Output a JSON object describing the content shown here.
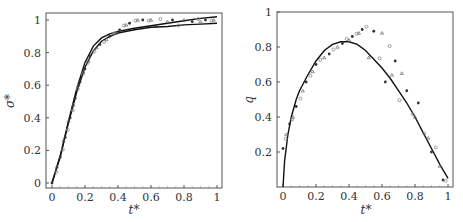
{
  "chart_data": [
    {
      "type": "scatter",
      "title": "",
      "xlabel": "t*",
      "ylabel": "σ*",
      "xlim": [
        0,
        1
      ],
      "ylim": [
        0,
        1.03
      ],
      "xticks": [
        "0",
        "0.2",
        "0.4",
        "0.6",
        "0.8",
        "1"
      ],
      "yticks": [
        "0",
        "0.2",
        "0.4",
        "0.6",
        "0.8",
        "1"
      ],
      "grid": false,
      "legend": null,
      "series": [
        {
          "name": "model curve",
          "kind": "line",
          "x": [
            0,
            0.05,
            0.1,
            0.15,
            0.2,
            0.25,
            0.3,
            0.35,
            0.4,
            0.5,
            0.6,
            0.7,
            0.8,
            0.9,
            1.0
          ],
          "y": [
            0,
            0.17,
            0.38,
            0.58,
            0.74,
            0.84,
            0.89,
            0.915,
            0.93,
            0.95,
            0.965,
            0.98,
            0.995,
            1.01,
            1.02
          ]
        },
        {
          "name": "model curve 2",
          "kind": "line",
          "x": [
            0,
            0.05,
            0.1,
            0.15,
            0.2,
            0.25,
            0.3,
            0.35,
            0.4,
            0.5,
            0.6,
            0.7,
            0.8,
            0.9,
            1.0
          ],
          "y": [
            0,
            0.16,
            0.37,
            0.56,
            0.71,
            0.81,
            0.87,
            0.9,
            0.92,
            0.94,
            0.955,
            0.96,
            0.97,
            0.975,
            0.98
          ]
        },
        {
          "name": "experimental data",
          "kind": "scatter",
          "x": [
            0.0,
            0.02,
            0.03,
            0.05,
            0.06,
            0.07,
            0.08,
            0.09,
            0.1,
            0.11,
            0.12,
            0.13,
            0.14,
            0.15,
            0.16,
            0.17,
            0.18,
            0.19,
            0.2,
            0.21,
            0.22,
            0.23,
            0.25,
            0.27,
            0.29,
            0.31,
            0.33,
            0.35,
            0.37,
            0.39,
            0.41,
            0.43,
            0.45,
            0.47,
            0.5,
            0.52,
            0.55,
            0.58,
            0.6,
            0.63,
            0.65,
            0.7,
            0.73,
            0.76,
            0.8,
            0.85,
            0.88,
            0.9,
            0.93,
            0.96,
            0.98
          ],
          "y": [
            0.0,
            0.06,
            0.1,
            0.16,
            0.2,
            0.26,
            0.28,
            0.32,
            0.38,
            0.4,
            0.44,
            0.48,
            0.52,
            0.57,
            0.6,
            0.62,
            0.66,
            0.68,
            0.7,
            0.73,
            0.75,
            0.78,
            0.8,
            0.83,
            0.85,
            0.86,
            0.88,
            0.9,
            0.91,
            0.92,
            0.94,
            0.96,
            0.97,
            0.98,
            0.99,
            1.0,
            1.0,
            0.99,
            1.0,
            0.96,
            1.0,
            0.99,
            1.0,
            0.96,
            1.0,
            0.99,
            1.0,
            0.99,
            1.0,
            0.99,
            1.0
          ]
        }
      ]
    },
    {
      "type": "scatter",
      "title": "",
      "xlabel": "t*",
      "ylabel": "q",
      "xlim": [
        0,
        1
      ],
      "ylim": [
        0,
        1
      ],
      "xticks": [
        "0",
        "0.2",
        "0.4",
        "0.6",
        "0.8",
        "1"
      ],
      "yticks": [
        "0.2",
        "0.4",
        "0.6",
        "0.8",
        "1"
      ],
      "grid": false,
      "legend": null,
      "series": [
        {
          "name": "model curve",
          "kind": "line",
          "x": [
            0,
            0.01,
            0.03,
            0.05,
            0.08,
            0.1,
            0.15,
            0.2,
            0.25,
            0.3,
            0.35,
            0.4,
            0.45,
            0.5,
            0.55,
            0.6,
            0.65,
            0.7,
            0.75,
            0.8,
            0.85,
            0.9,
            0.95,
            1.0
          ],
          "y": [
            0,
            0.15,
            0.3,
            0.4,
            0.5,
            0.55,
            0.64,
            0.72,
            0.78,
            0.815,
            0.83,
            0.83,
            0.815,
            0.78,
            0.73,
            0.68,
            0.62,
            0.55,
            0.48,
            0.4,
            0.31,
            0.22,
            0.13,
            0.05
          ]
        },
        {
          "name": "experimental data",
          "kind": "scatter",
          "x": [
            0.0,
            0.01,
            0.02,
            0.04,
            0.05,
            0.06,
            0.08,
            0.1,
            0.12,
            0.14,
            0.16,
            0.18,
            0.2,
            0.22,
            0.25,
            0.28,
            0.3,
            0.33,
            0.36,
            0.38,
            0.4,
            0.42,
            0.44,
            0.46,
            0.48,
            0.5,
            0.52,
            0.55,
            0.58,
            0.6,
            0.62,
            0.64,
            0.66,
            0.68,
            0.7,
            0.72,
            0.75,
            0.78,
            0.8,
            0.82,
            0.85,
            0.88,
            0.9,
            0.92,
            0.95,
            0.97,
            0.98
          ],
          "y": [
            0.22,
            0.27,
            0.3,
            0.36,
            0.38,
            0.4,
            0.46,
            0.5,
            0.55,
            0.6,
            0.63,
            0.66,
            0.7,
            0.72,
            0.74,
            0.76,
            0.78,
            0.8,
            0.82,
            0.84,
            0.84,
            0.86,
            0.87,
            0.88,
            0.9,
            0.91,
            0.74,
            0.89,
            0.73,
            0.88,
            0.6,
            0.8,
            0.64,
            0.72,
            0.49,
            0.65,
            0.55,
            0.41,
            0.4,
            0.48,
            0.3,
            0.28,
            0.2,
            0.22,
            0.12,
            0.04,
            0.03
          ]
        }
      ]
    }
  ],
  "plots": {
    "left": {
      "ylabel": "σ*",
      "ylabel_sup": "",
      "xlabel": "t*"
    },
    "right": {
      "ylabel": "q",
      "xlabel": "t*"
    }
  }
}
